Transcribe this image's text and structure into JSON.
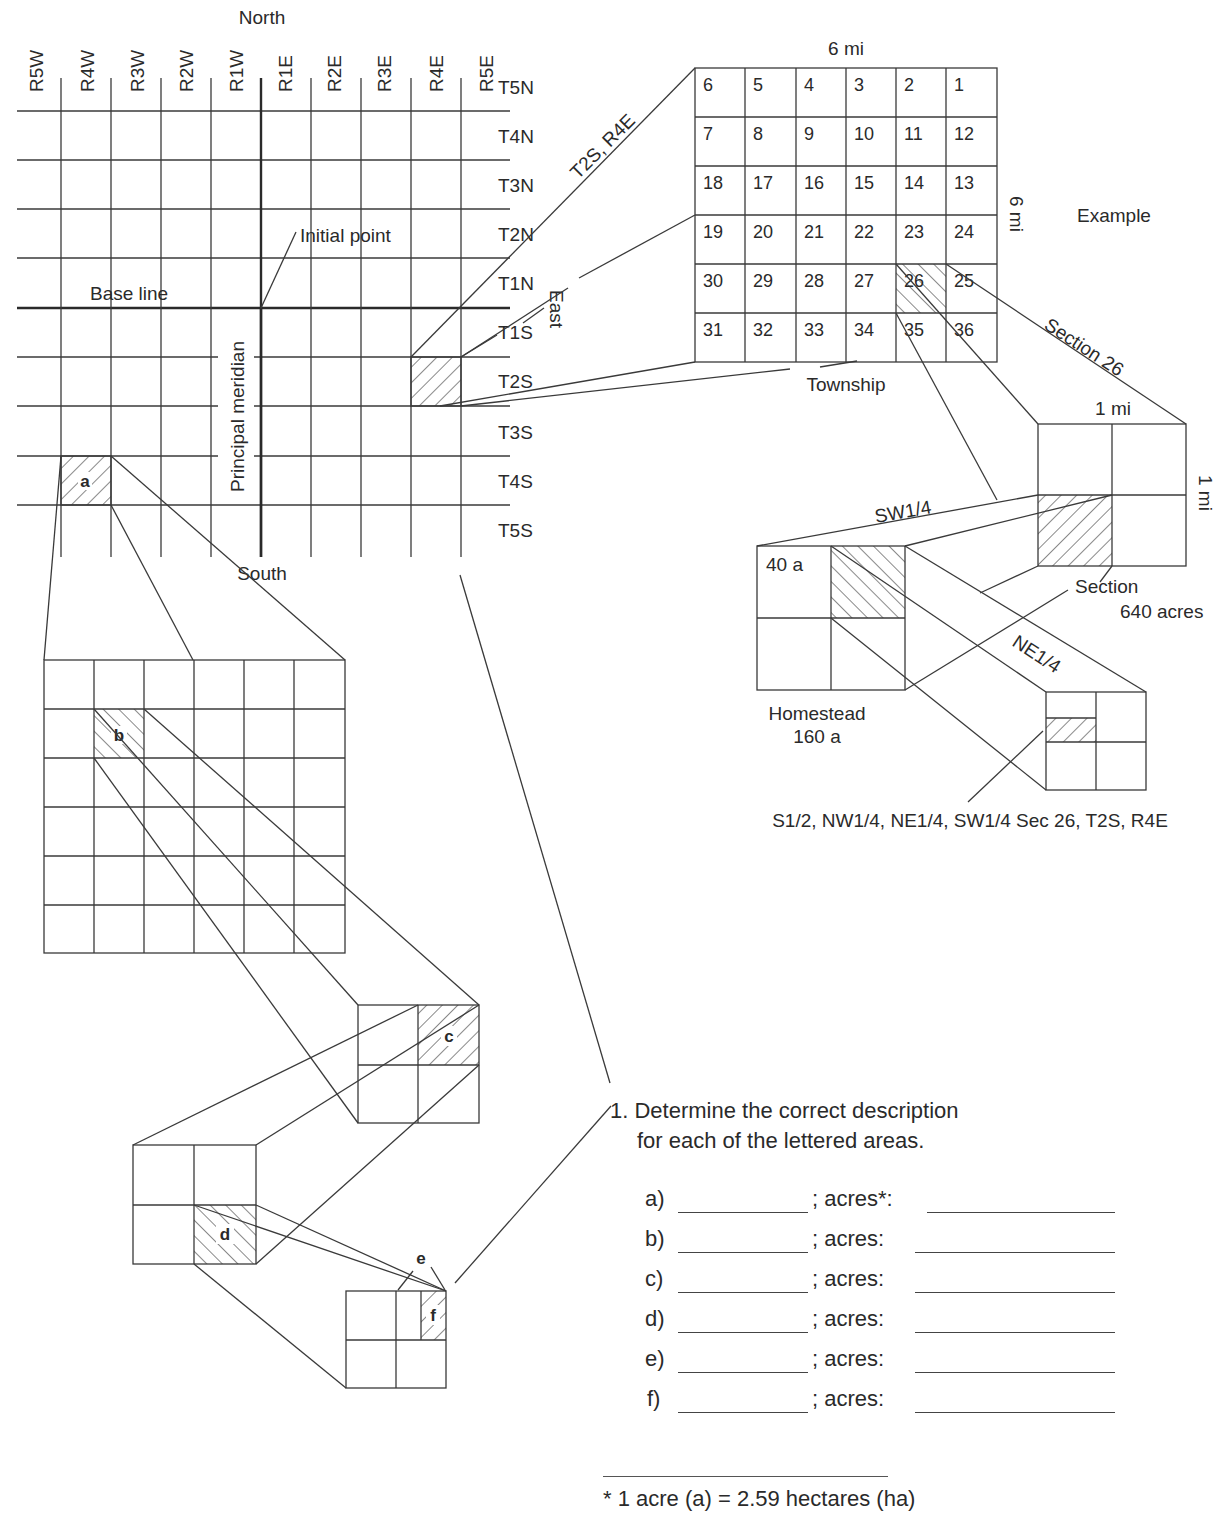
{
  "main_grid": {
    "compass": {
      "north": "North",
      "south": "South",
      "east": "East"
    },
    "ranges": [
      "R5W",
      "R4W",
      "R3W",
      "R2W",
      "R1W",
      "R1E",
      "R2E",
      "R3E",
      "R4E",
      "R5E"
    ],
    "townships": [
      "T5N",
      "T4N",
      "T3N",
      "T2N",
      "T1N",
      "T1S",
      "T2S",
      "T3S",
      "T4S",
      "T5S"
    ],
    "labels": {
      "initial_point": "Initial point",
      "base_line": "Base line",
      "principal_meridian": "Principal meridian",
      "area_a": "a"
    }
  },
  "township_detail": {
    "callout": "T2S, R4E",
    "width_label": "6 mi",
    "height_label": "6 mi",
    "caption": "Township",
    "example_label": "Example",
    "sections": [
      [
        6,
        5,
        4,
        3,
        2,
        1
      ],
      [
        7,
        8,
        9,
        10,
        11,
        12
      ],
      [
        18,
        17,
        16,
        15,
        14,
        13
      ],
      [
        19,
        20,
        21,
        22,
        23,
        24
      ],
      [
        30,
        29,
        28,
        27,
        26,
        25
      ],
      [
        31,
        32,
        33,
        34,
        35,
        36
      ]
    ],
    "highlighted_section": 26
  },
  "section_detail": {
    "callout": "Section 26",
    "width_label": "1 mi",
    "height_label": "1 mi",
    "caption": "Section",
    "acres": "640 acres"
  },
  "quarter_detail": {
    "callout": "SW1/4",
    "cell_label": "40 a",
    "caption_line1": "Homestead",
    "caption_line2": "160 a"
  },
  "sixteenth_detail": {
    "callout": "NE1/4",
    "example_description": "S1/2, NW1/4, NE1/4, SW1/4 Sec 26, T2S, R4E"
  },
  "exercise_areas": {
    "b": "b",
    "c": "c",
    "d": "d",
    "e": "e",
    "f": "f"
  },
  "question": {
    "line1": "1. Determine the correct description",
    "line2": "for each of the lettered areas.",
    "answers": [
      {
        "letter": "a)",
        "acres_label": "; acres*:"
      },
      {
        "letter": "b)",
        "acres_label": "; acres:"
      },
      {
        "letter": "c)",
        "acres_label": "; acres:"
      },
      {
        "letter": "d)",
        "acres_label": "; acres:"
      },
      {
        "letter": "e)",
        "acres_label": "; acres:"
      },
      {
        "letter": "f)",
        "acres_label": "; acres:"
      }
    ]
  },
  "footnote": "* 1 acre (a) = 2.59 hectares (ha)"
}
